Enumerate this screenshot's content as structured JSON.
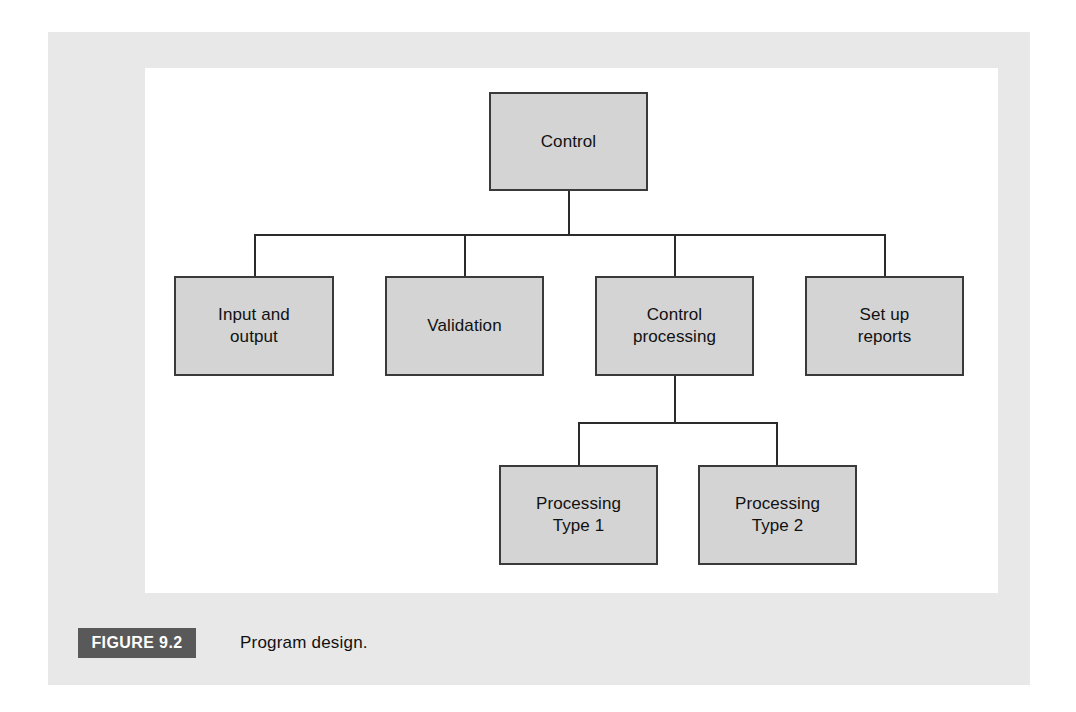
{
  "figure": {
    "tag": "FIGURE 9.2",
    "caption": "Program design.",
    "tag_background": "#595959",
    "tag_text_color": "#ffffff",
    "frame_background": "#e8e8e8",
    "canvas_background": "#ffffff"
  },
  "diagram": {
    "type": "hierarchy-chart",
    "node_fill": "#d4d4d4",
    "node_border": "#3a3a3a",
    "connector_color": "#2b2b2b",
    "nodes": [
      {
        "id": "control",
        "label": "Control",
        "level": 0
      },
      {
        "id": "input-and-output",
        "label": "Input and\noutput",
        "level": 1
      },
      {
        "id": "validation",
        "label": "Validation",
        "level": 1
      },
      {
        "id": "control-processing",
        "label": "Control\nprocessing",
        "level": 1
      },
      {
        "id": "set-up-reports",
        "label": "Set up\nreports",
        "level": 1
      },
      {
        "id": "processing-type-1",
        "label": "Processing\nType 1",
        "level": 2
      },
      {
        "id": "processing-type-2",
        "label": "Processing\nType 2",
        "level": 2
      }
    ],
    "edges": [
      {
        "from": "control",
        "to": "input-and-output"
      },
      {
        "from": "control",
        "to": "validation"
      },
      {
        "from": "control",
        "to": "control-processing"
      },
      {
        "from": "control",
        "to": "set-up-reports"
      },
      {
        "from": "control-processing",
        "to": "processing-type-1"
      },
      {
        "from": "control-processing",
        "to": "processing-type-2"
      }
    ]
  }
}
